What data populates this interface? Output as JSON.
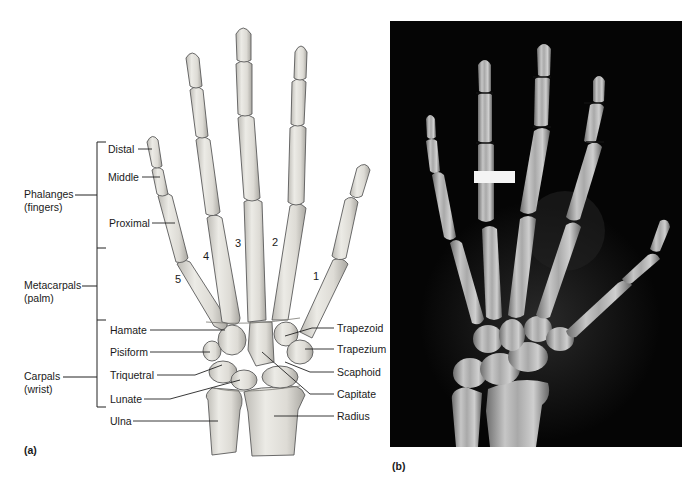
{
  "figure": {
    "panel_a": {
      "letter": "(a)",
      "groups": [
        {
          "name": "Phalanges",
          "sub": "(fingers)"
        },
        {
          "name": "Metacarpals",
          "sub": "(palm)"
        },
        {
          "name": "Carpals",
          "sub": "(wrist)"
        }
      ],
      "left_labels": [
        "Distal",
        "Middle",
        "Proximal",
        "Hamate",
        "Pisiform",
        "Triquetral",
        "Lunate",
        "Ulna"
      ],
      "right_labels": [
        "Trapezoid",
        "Trapezium",
        "Scaphoid",
        "Capitate",
        "Radius"
      ],
      "digit_numbers": [
        "1",
        "2",
        "3",
        "4",
        "5"
      ]
    },
    "panel_b": {
      "letter": "(b)",
      "description": "X-ray radiograph of hand and wrist"
    },
    "colors": {
      "bone_fill": "#e4e2dc",
      "bone_stroke": "#5a5a5a",
      "xray_bg": "#050505",
      "xray_bone": "#c9c9c9",
      "leader_line": "#222222"
    }
  }
}
